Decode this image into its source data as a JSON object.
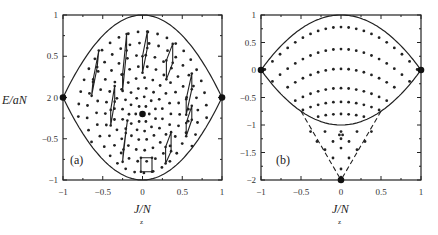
{
  "chart_data": [
    {
      "type": "scatter",
      "panel": "a",
      "panel_label": "(a)",
      "xlabel": "J/N",
      "xlabel_subscript": "z",
      "ylabel": "E/aN",
      "xlim": [
        -1,
        1
      ],
      "ylim": [
        -1,
        1
      ],
      "xticks": [
        "-1",
        "-0.5",
        "0",
        "0.5",
        "1"
      ],
      "yticks": [
        "-1",
        "-0.5",
        "2 0",
        "0.5",
        "1"
      ],
      "boundary": "upper: E = 1 - Jz^2 ; lower: E = -(1 - Jz^2) (lens-shaped separatrix)",
      "large_points": [
        [
          -1,
          0
        ],
        [
          1,
          0
        ],
        [
          0,
          -0.2
        ]
      ],
      "rings_description": "concentric rings of small dots around (0,-0.2) inside the lens",
      "rhombi_description": "small parallelograms connecting dots, arranged tangentially on rings",
      "rhombi": [
        [
          [
            -0.62,
            0.22
          ],
          [
            -0.55,
            0.57
          ],
          [
            -0.57,
            0.37
          ],
          [
            -0.64,
            0.02
          ]
        ],
        [
          [
            -0.25,
            0.28
          ],
          [
            -0.2,
            0.77
          ],
          [
            -0.2,
            0.57
          ],
          [
            -0.25,
            0.08
          ]
        ],
        [
          [
            0,
            0.5
          ],
          [
            0.06,
            0.8
          ],
          [
            0.06,
            0.6
          ],
          [
            0,
            0.3
          ]
        ],
        [
          [
            0.3,
            0.45
          ],
          [
            0.38,
            0.65
          ],
          [
            0.38,
            0.42
          ],
          [
            0.3,
            0.22
          ]
        ],
        [
          [
            0.55,
            -0.02
          ],
          [
            0.62,
            0.29
          ],
          [
            0.62,
            0.1
          ],
          [
            0.55,
            -0.21
          ]
        ],
        [
          [
            -0.4,
            -0.15
          ],
          [
            -0.35,
            0.14
          ],
          [
            -0.35,
            -0.05
          ],
          [
            -0.4,
            -0.34
          ]
        ],
        [
          [
            -0.24,
            -0.63
          ],
          [
            -0.19,
            -0.28
          ],
          [
            -0.21,
            -0.43
          ],
          [
            -0.25,
            -0.78
          ]
        ],
        [
          [
            0.55,
            -0.31
          ],
          [
            0.62,
            -0.1
          ],
          [
            0.62,
            -0.27
          ],
          [
            0.55,
            -0.47
          ]
        ],
        [
          [
            0.29,
            -0.6
          ],
          [
            0.36,
            -0.42
          ],
          [
            0.36,
            -0.65
          ],
          [
            0.29,
            -0.8
          ]
        ],
        [
          [
            -0.02,
            -0.73
          ],
          [
            0.12,
            -0.73
          ],
          [
            0.12,
            -0.9
          ],
          [
            -0.02,
            -0.9
          ]
        ]
      ]
    },
    {
      "type": "scatter",
      "panel": "b",
      "panel_label": "(b)",
      "xlabel": "J/N",
      "xlabel_subscript": "z",
      "ylabel": "",
      "xlim": [
        -1,
        1
      ],
      "ylim": [
        -2,
        1
      ],
      "xticks": [
        "-1",
        "-0.5",
        "0",
        "0.5",
        "1"
      ],
      "yticks": [
        "-2",
        "-1.5",
        "-1",
        "-0.5",
        "0",
        "0.5",
        "1"
      ],
      "boundary": "upper: E = 1 - Jz^2 ; lower: E = -(1 - (1-|Jz|)^2)... solid arc reaching E=-1 at Jz=0; dashed lines from (±0.5,-0.75) down to (0,-2)",
      "large_points": [
        [
          -1,
          0
        ],
        [
          1,
          0
        ],
        [
          0,
          -2
        ]
      ],
      "arc_rows_E_at_center": [
        0.78,
        0.38,
        0.02,
        -0.33,
        -0.58,
        -0.8,
        -1.0
      ],
      "dashed_lines": [
        [
          [
            -0.5,
            -0.75
          ],
          [
            0,
            -2
          ]
        ],
        [
          [
            0.5,
            -0.75
          ],
          [
            0,
            -2
          ]
        ]
      ]
    }
  ]
}
